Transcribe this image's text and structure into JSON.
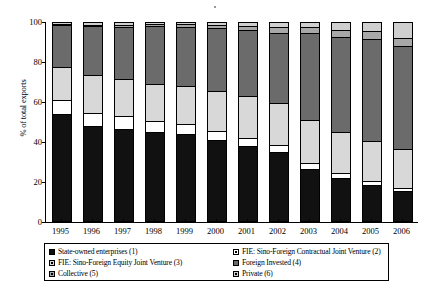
{
  "chart_data": {
    "type": "bar",
    "subtype": "stacked-100-percent",
    "title": "",
    "xlabel": "",
    "ylabel": "% of total exports",
    "ylim": [
      0,
      100
    ],
    "yticks": [
      0,
      20,
      40,
      60,
      80,
      100
    ],
    "grid": false,
    "legend_position": "bottom",
    "categories": [
      "1995",
      "1996",
      "1997",
      "1998",
      "1999",
      "2000",
      "2001",
      "2002",
      "2003",
      "2004",
      "2005",
      "2006"
    ],
    "series": [
      {
        "name": "State-owned enterprises  (1)",
        "key": "state_owned",
        "color": "#111111",
        "values": [
          53.5,
          47.5,
          46.0,
          44.5,
          43.5,
          40.5,
          37.5,
          34.5,
          26.0,
          21.0,
          17.5,
          14.5
        ]
      },
      {
        "name": "FIE: Sino-Foreign Contractual Joint Venture (2)",
        "key": "contractual_jv",
        "color": "#ffffff",
        "values": [
          7.0,
          6.5,
          6.5,
          5.5,
          5.0,
          4.5,
          4.0,
          3.5,
          3.0,
          2.5,
          2.0,
          1.5
        ]
      },
      {
        "name": "FIE: Sino-Foreign Equity Joint Venture (3)",
        "key": "equity_jv",
        "color": "#d8d8d8",
        "values": [
          17.0,
          19.0,
          18.5,
          18.5,
          19.0,
          20.0,
          21.0,
          21.0,
          21.5,
          21.0,
          20.5,
          20.0
        ]
      },
      {
        "name": "Foreign Invested (4)",
        "key": "foreign_invested",
        "color": "#6b6b6b",
        "values": [
          21.0,
          25.0,
          26.5,
          29.5,
          30.0,
          32.0,
          33.5,
          35.5,
          44.0,
          48.0,
          51.5,
          52.0
        ]
      },
      {
        "name": "Collective (5)",
        "key": "collective",
        "color": "#a8a8a8",
        "values": [
          0.5,
          0.5,
          1.0,
          1.0,
          1.5,
          1.5,
          2.0,
          3.0,
          3.0,
          3.5,
          4.0,
          4.0
        ]
      },
      {
        "name": "Private (6)",
        "key": "private",
        "color": "#cfcfcf",
        "values": [
          1.0,
          1.5,
          1.5,
          1.0,
          1.0,
          1.5,
          2.0,
          2.5,
          2.5,
          4.0,
          4.5,
          8.0
        ]
      }
    ]
  },
  "legend": {
    "items": [
      {
        "label": "State-owned enterprises  (1)",
        "swatch": "solid-black",
        "color": "#111111"
      },
      {
        "label": "FIE: Sino-Foreign Contractual Joint Venture (2)",
        "swatch": "outline-white",
        "color": "#ffffff"
      },
      {
        "label": "FIE: Sino-Foreign Equity Joint Venture (3)",
        "swatch": "outline-lightgray",
        "color": "#d8d8d8"
      },
      {
        "label": "Foreign Invested (4)",
        "swatch": "solid-darkgray",
        "color": "#6b6b6b"
      },
      {
        "label": "Collective (5)",
        "swatch": "outline-gray",
        "color": "#a8a8a8"
      },
      {
        "label": "Private (6)",
        "swatch": "outline-lightgray",
        "color": "#cfcfcf"
      }
    ]
  }
}
